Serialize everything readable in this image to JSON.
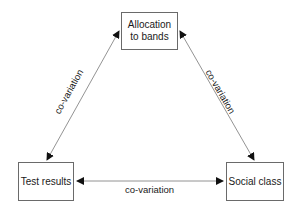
{
  "diagram": {
    "nodes": [
      {
        "id": "allocation",
        "label_line1": "Allocation",
        "label_line2": "to bands"
      },
      {
        "id": "test",
        "label": "Test results"
      },
      {
        "id": "social",
        "label": "Social class"
      }
    ],
    "edges": [
      {
        "from": "allocation",
        "to": "test",
        "label": "co-variation",
        "direction": "bidirectional"
      },
      {
        "from": "allocation",
        "to": "social",
        "label": "co-variation",
        "direction": "bidirectional"
      },
      {
        "from": "test",
        "to": "social",
        "label": "co-variation",
        "direction": "bidirectional"
      }
    ]
  }
}
